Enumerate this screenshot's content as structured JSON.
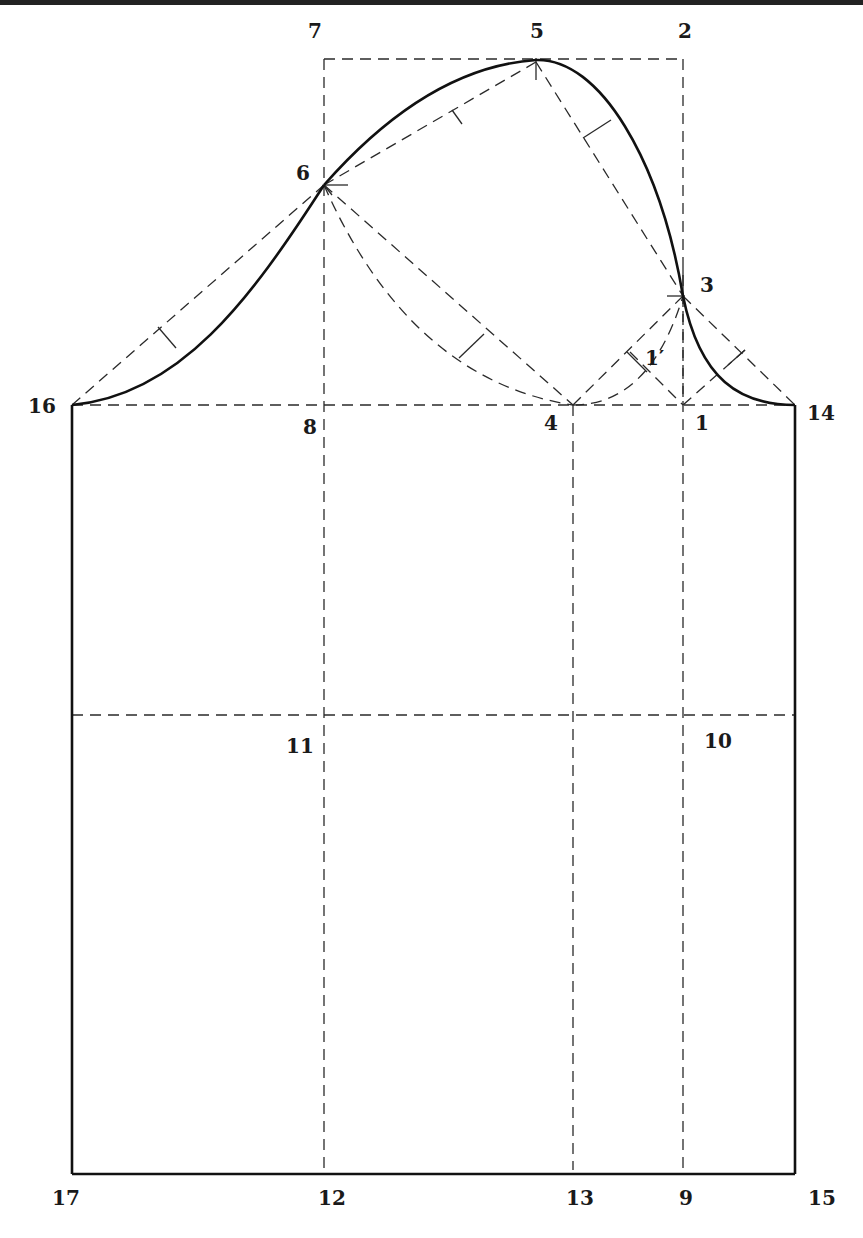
{
  "diagram": {
    "colors": {
      "ink": "#111111",
      "construction": "#2a2a2a",
      "background": "#ffffff"
    },
    "points": {
      "p1": "1",
      "p1prime": "1′",
      "p2": "2",
      "p3": "3",
      "p4": "4",
      "p5": "5",
      "p6": "6",
      "p7": "7",
      "p8": "8",
      "p9": "9",
      "p10": "10",
      "p11": "11",
      "p12": "12",
      "p13": "13",
      "p14": "14",
      "p15": "15",
      "p16": "16",
      "p17": "17"
    },
    "lines": {
      "solid": [
        "sleeve cap curve 16-6-5-3-14",
        "side seam 16-17",
        "side seam 14-15",
        "hem 17-15"
      ],
      "dashed": [
        "rectangle 7-2 / 8-1",
        "cap line 16-14",
        "elbow line 11-10",
        "grain line 8-12",
        "grain line 4-13",
        "grain line 1-9",
        "guide 16-6",
        "guide 6-5",
        "guide 5-3",
        "guide 3-14",
        "guide 6-4",
        "guide 4-3",
        "guide 3-1′-1"
      ]
    }
  }
}
